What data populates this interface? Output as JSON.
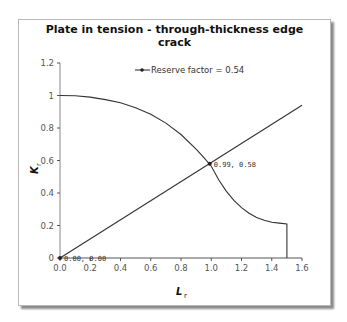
{
  "chart_data": {
    "type": "line",
    "title": "Plate in tension - through-thickness edge crack",
    "title_lines": [
      "Plate in tension - through-thickness edge",
      "crack"
    ],
    "xlabel": "Lr",
    "xlabel_main": "L",
    "xlabel_sub": "r",
    "ylabel": "Kr",
    "ylabel_main": "K",
    "ylabel_sub": "r",
    "xlim": [
      0,
      1.6
    ],
    "ylim": [
      0,
      1.2
    ],
    "x_ticks": [
      "0.0",
      "0.2",
      "0.4",
      "0.6",
      "0.8",
      "1.0",
      "1.2",
      "1.4",
      "1.6"
    ],
    "y_ticks": [
      "0",
      "0.2",
      "0.4",
      "0.6",
      "0.8",
      "1",
      "1.2"
    ],
    "grid": false,
    "legend": {
      "position": "top",
      "entries": [
        "Reserve factor = 0.54"
      ]
    },
    "series": [
      {
        "name": "Failure assessment curve",
        "x": [
          0.0,
          0.1,
          0.2,
          0.3,
          0.4,
          0.5,
          0.6,
          0.7,
          0.8,
          0.9,
          0.95,
          1.0,
          1.05,
          1.1,
          1.15,
          1.2,
          1.25,
          1.3,
          1.35,
          1.4,
          1.45,
          1.5,
          1.5
        ],
        "y": [
          1.0,
          0.998,
          0.99,
          0.975,
          0.955,
          0.925,
          0.885,
          0.83,
          0.76,
          0.67,
          0.62,
          0.565,
          0.48,
          0.41,
          0.355,
          0.31,
          0.275,
          0.25,
          0.232,
          0.22,
          0.215,
          0.21,
          0.0
        ]
      },
      {
        "name": "Reserve factor = 0.54",
        "x": [
          0.0,
          1.6
        ],
        "y": [
          0.0,
          0.94
        ]
      }
    ],
    "annotations": [
      {
        "x": 0.0,
        "y": 0.0,
        "text": "0.00, 0.00"
      },
      {
        "x": 0.99,
        "y": 0.58,
        "text": "0.99, 0.58"
      }
    ]
  }
}
